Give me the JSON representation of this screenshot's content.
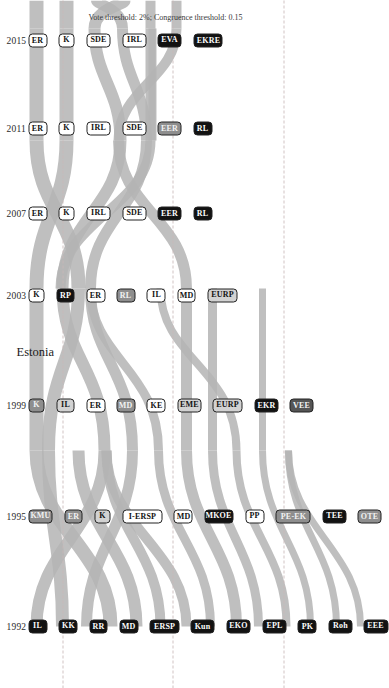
{
  "figure": {
    "country_label": "Estonia",
    "footnote": "Vote threshold: 2%; Congruence threshold: 0.15",
    "orientation": "rotated-90",
    "flow_color": "#b3b3b3"
  },
  "axis": {
    "years": [
      "1992",
      "1995",
      "1999",
      "2003",
      "2007",
      "2011",
      "2015"
    ]
  },
  "chart_data": {
    "type": "alluvial",
    "title": "Estonia",
    "subtitle": "Vote threshold: 2%; Congruence threshold: 0.15",
    "xlabel": "",
    "ylabel": "",
    "categories": [
      "1992",
      "1995",
      "1999",
      "2003",
      "2007",
      "2011",
      "2015"
    ],
    "legend_position": "none",
    "grid": true,
    "columns": [
      {
        "year": "1992",
        "nodes": [
          {
            "label": "IL",
            "shade": "black"
          },
          {
            "label": "KK",
            "shade": "black"
          },
          {
            "label": "RR",
            "shade": "black"
          },
          {
            "label": "MD",
            "shade": "black"
          },
          {
            "label": "ERSP",
            "shade": "black"
          },
          {
            "label": "Kun",
            "shade": "black"
          },
          {
            "label": "EKO",
            "shade": "black"
          },
          {
            "label": "EPL",
            "shade": "black"
          },
          {
            "label": "PK",
            "shade": "black"
          },
          {
            "label": "Roh",
            "shade": "black"
          },
          {
            "label": "EEE",
            "shade": "black"
          }
        ]
      },
      {
        "year": "1995",
        "nodes": [
          {
            "label": "KMU",
            "shade": "mgray"
          },
          {
            "label": "ER",
            "shade": "mgray"
          },
          {
            "label": "K",
            "shade": "lgray"
          },
          {
            "label": "I-ERSP",
            "shade": "white"
          },
          {
            "label": "MD",
            "shade": "white"
          },
          {
            "label": "MKOE",
            "shade": "black"
          },
          {
            "label": "PP",
            "shade": "white"
          },
          {
            "label": "PE-EK",
            "shade": "mgray"
          },
          {
            "label": "TEE",
            "shade": "black"
          },
          {
            "label": "OTE",
            "shade": "mgray"
          }
        ]
      },
      {
        "year": "1999",
        "nodes": [
          {
            "label": "K",
            "shade": "mgray"
          },
          {
            "label": "IL",
            "shade": "lgray"
          },
          {
            "label": "ER",
            "shade": "white"
          },
          {
            "label": "MD",
            "shade": "mgray"
          },
          {
            "label": "KE",
            "shade": "white"
          },
          {
            "label": "EME",
            "shade": "lgray"
          },
          {
            "label": "EURP",
            "shade": "lgray"
          },
          {
            "label": "EKR",
            "shade": "black"
          },
          {
            "label": "VEE",
            "shade": "dgray"
          }
        ]
      },
      {
        "year": "2003",
        "nodes": [
          {
            "label": "K",
            "shade": "white"
          },
          {
            "label": "RP",
            "shade": "black"
          },
          {
            "label": "ER",
            "shade": "white"
          },
          {
            "label": "RL",
            "shade": "mgray"
          },
          {
            "label": "IL",
            "shade": "white"
          },
          {
            "label": "MD",
            "shade": "white"
          },
          {
            "label": "EURP",
            "shade": "lgray"
          }
        ]
      },
      {
        "year": "2007",
        "nodes": [
          {
            "label": "ER",
            "shade": "white"
          },
          {
            "label": "K",
            "shade": "white"
          },
          {
            "label": "IRL",
            "shade": "white"
          },
          {
            "label": "SDE",
            "shade": "white"
          },
          {
            "label": "EER",
            "shade": "black"
          },
          {
            "label": "RL",
            "shade": "black"
          }
        ]
      },
      {
        "year": "2011",
        "nodes": [
          {
            "label": "ER",
            "shade": "white"
          },
          {
            "label": "K",
            "shade": "white"
          },
          {
            "label": "IRL",
            "shade": "white"
          },
          {
            "label": "SDE",
            "shade": "white"
          },
          {
            "label": "EER",
            "shade": "mgray"
          },
          {
            "label": "RL",
            "shade": "black"
          }
        ]
      },
      {
        "year": "2015",
        "nodes": [
          {
            "label": "ER",
            "shade": "white"
          },
          {
            "label": "K",
            "shade": "white"
          },
          {
            "label": "SDE",
            "shade": "white"
          },
          {
            "label": "IRL",
            "shade": "white"
          },
          {
            "label": "EVA",
            "shade": "black"
          },
          {
            "label": "EKRE",
            "shade": "black"
          }
        ]
      }
    ]
  }
}
